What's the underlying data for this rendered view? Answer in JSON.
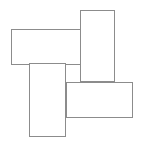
{
  "figure": {
    "canvas": {
      "width": 159,
      "height": 150,
      "background_color": "#ffffff"
    },
    "style": {
      "stroke_color": "#8c8c8c",
      "stroke_width": 1,
      "fill_color": "#ffffff"
    },
    "shape_count": 4,
    "shapes": [
      {
        "id": "rect-top-left-horizontal",
        "label": "",
        "orientation": "horizontal",
        "x": 11,
        "y": 29,
        "width": 70,
        "height": 36,
        "z": 1,
        "stroke_color": "#8c8c8c",
        "fill_color": "#ffffff"
      },
      {
        "id": "rect-top-right-vertical",
        "label": "",
        "orientation": "vertical",
        "x": 80,
        "y": 10,
        "width": 35,
        "height": 72,
        "z": 2,
        "stroke_color": "#8c8c8c",
        "fill_color": "#ffffff"
      },
      {
        "id": "rect-bottom-right-horizontal",
        "label": "",
        "orientation": "horizontal",
        "x": 66,
        "y": 82,
        "width": 67,
        "height": 36,
        "z": 3,
        "stroke_color": "#8c8c8c",
        "fill_color": "#ffffff"
      },
      {
        "id": "rect-bottom-left-vertical",
        "label": "",
        "orientation": "vertical",
        "x": 29,
        "y": 63,
        "width": 37,
        "height": 74,
        "z": 4,
        "stroke_color": "#8c8c8c",
        "fill_color": "#ffffff"
      }
    ]
  }
}
